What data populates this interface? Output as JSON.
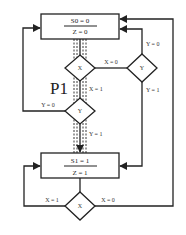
{
  "diagram": {
    "colors": {
      "line": "#222222",
      "background": "#ffffff",
      "text": "#333333"
    },
    "states": [
      {
        "id": "S0",
        "label_top": "S0 = 0",
        "label_bottom": "Z = 0"
      },
      {
        "id": "S1",
        "label_top": "S1 = 1",
        "label_bottom": "Z = 1"
      }
    ],
    "decisions": [
      {
        "id": "x-top",
        "label": "X"
      },
      {
        "id": "y-mid",
        "label": "Y"
      },
      {
        "id": "y-right",
        "label": "Y"
      },
      {
        "id": "x-bottom",
        "label": "X"
      }
    ],
    "edge_labels": {
      "x_top_false": "X = 0",
      "x_top_true": "X = 1",
      "y_mid_false": "Y = 0",
      "y_mid_true": "Y = 1",
      "y_right_false": "Y = 0",
      "y_right_true": "Y = 1",
      "x_bottom_true": "X = 1",
      "x_bottom_false": "X = 0"
    },
    "path_label": "P1"
  }
}
